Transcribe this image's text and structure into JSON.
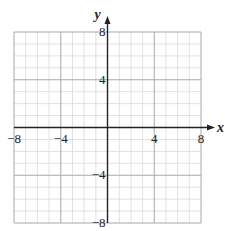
{
  "chart_data": {
    "type": "scatter",
    "title": "",
    "xlabel": "x",
    "ylabel": "y",
    "xlim": [
      -8,
      8
    ],
    "ylim": [
      -8,
      8
    ],
    "grid": true,
    "grid_step": 1,
    "major_grid_step": 4,
    "x_ticks": [
      -8,
      -4,
      4,
      8
    ],
    "y_ticks": [
      8,
      4,
      -4,
      -8
    ],
    "x_tick_labels": [
      "−8",
      "−4",
      "4",
      "8"
    ],
    "y_tick_labels": [
      "8",
      "4",
      "−4",
      "−8"
    ],
    "series": []
  },
  "colors": {
    "minor_grid": "#d9d9d9",
    "major_grid": "#a8a8a8",
    "axis": "#222222"
  }
}
